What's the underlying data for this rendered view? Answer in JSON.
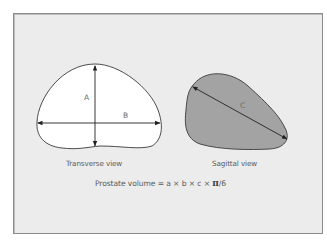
{
  "figure": {
    "transverse": {
      "caption": "Transverse view",
      "label_a": "A",
      "label_b": "B",
      "fill": "#ffffff"
    },
    "sagittal": {
      "caption": "Sagittal view",
      "label_c": "C",
      "fill": "#a3a3a3"
    },
    "formula": {
      "prefix": "Prostate volume = a × b × c × ",
      "pi": "π",
      "suffix": "/6"
    },
    "colors": {
      "frame_bg": "#ececec",
      "outline": "#3a3a3a",
      "text": "#5a5a5a"
    }
  }
}
